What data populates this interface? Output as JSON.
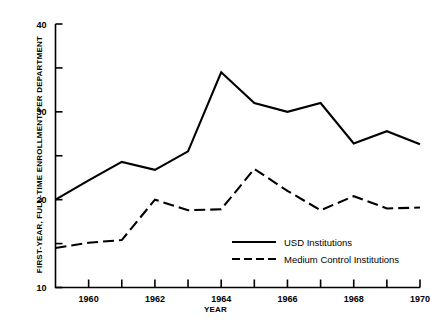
{
  "chart_data": {
    "type": "line",
    "title": "",
    "xlabel": "YEAR",
    "ylabel": "FIRST-YEAR, FULL-TIME ENROLLMENT PER DEPARTMENT",
    "x": [
      1959,
      1960,
      1961,
      1962,
      1963,
      1964,
      1965,
      1966,
      1967,
      1968,
      1969,
      1970
    ],
    "xlim": [
      1959,
      1970
    ],
    "ylim": [
      10,
      40
    ],
    "grid": false,
    "legend_position": "bottom-center",
    "xticks": [
      1960,
      1962,
      1964,
      1966,
      1968,
      1970
    ],
    "xticklabels": [
      "1960",
      "1962",
      "1964",
      "1966",
      "1968",
      "1970"
    ],
    "xminorticks": [
      1959,
      1961,
      1963,
      1965,
      1967,
      1969
    ],
    "yticks": [
      10,
      20,
      30,
      40
    ],
    "yticklabels": [
      "10",
      "20",
      "30",
      "40"
    ],
    "yminorticks": [
      15,
      25,
      35
    ],
    "series": [
      {
        "name": "USD Institutions",
        "style": "solid",
        "color": "#000000",
        "values": [
          20.0,
          22.2,
          24.3,
          23.4,
          25.5,
          34.5,
          31.0,
          30.0,
          31.0,
          26.4,
          27.8,
          26.3
        ]
      },
      {
        "name": "Medium Control Institutions",
        "style": "dashed",
        "color": "#000000",
        "values": [
          14.5,
          15.1,
          15.4,
          20.0,
          18.8,
          18.9,
          23.5,
          21.0,
          18.8,
          20.4,
          19.0,
          19.1
        ]
      }
    ]
  },
  "legend": {
    "entries": [
      {
        "label": "USD Institutions"
      },
      {
        "label": "Medium Control Institutions"
      }
    ]
  }
}
